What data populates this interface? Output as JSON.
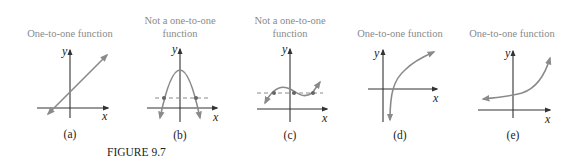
{
  "figure": {
    "caption": "FIGURE 9.7",
    "colors": {
      "curve": "#8a8a8a",
      "axis": "#333333",
      "title": "#8a8a8a"
    },
    "panels": [
      {
        "id": "a",
        "title_lines": [
          "One-to-one function"
        ],
        "label": "(a)",
        "x_axis": "x",
        "y_axis": "y",
        "curve": "increasing line"
      },
      {
        "id": "b",
        "title_lines": [
          "Not a one-to-one",
          "function"
        ],
        "label": "(b)",
        "x_axis": "x",
        "y_axis": "y",
        "curve": "downward parabola cut by dashed horizontal line at two points"
      },
      {
        "id": "c",
        "title_lines": [
          "Not a one-to-one",
          "function"
        ],
        "label": "(c)",
        "x_axis": "x",
        "y_axis": "y",
        "curve": "cubic cut by dashed horizontal line at three points"
      },
      {
        "id": "d",
        "title_lines": [
          "One-to-one function"
        ],
        "label": "(d)",
        "x_axis": "x",
        "y_axis": "y",
        "curve": "logarithmic increasing"
      },
      {
        "id": "e",
        "title_lines": [
          "One-to-one function"
        ],
        "label": "(e)",
        "x_axis": "x",
        "y_axis": "y",
        "curve": "exponential increasing"
      }
    ]
  }
}
